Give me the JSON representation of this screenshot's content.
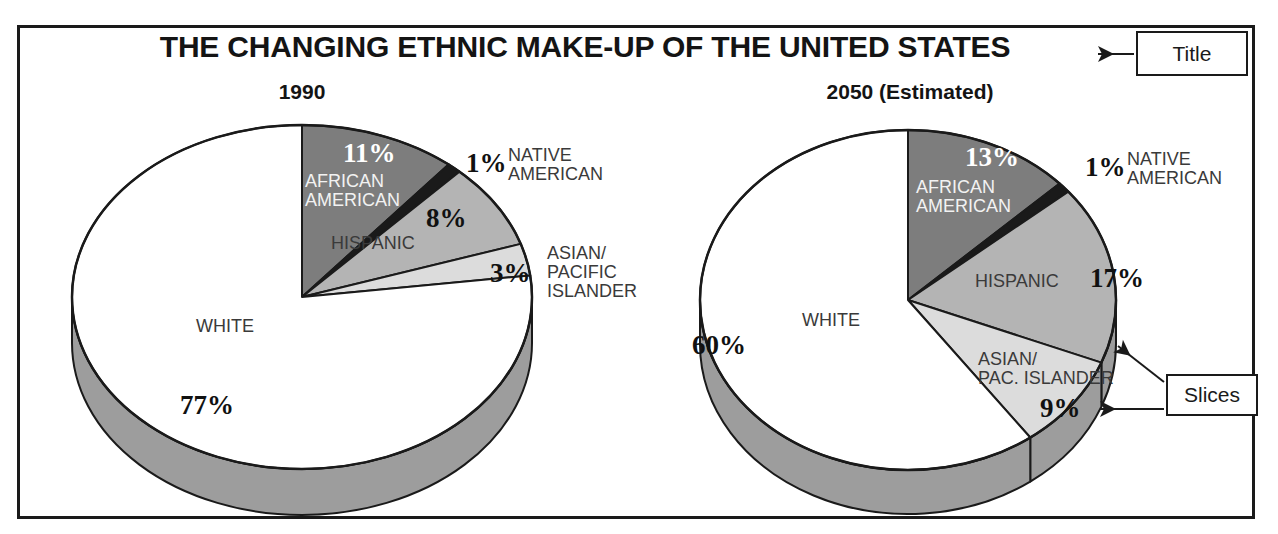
{
  "figure": {
    "title": "THE CHANGING ETHNIC MAKE-UP OF THE UNITED STATES",
    "callouts": [
      {
        "name": "title-callout",
        "label": "Title"
      },
      {
        "name": "slices-callout",
        "label": "Slices"
      }
    ]
  },
  "panels": [
    {
      "heading": "1990"
    },
    {
      "heading": "2050 (Estimated)"
    }
  ],
  "labels": {
    "p1": {
      "white_name": "WHITE",
      "white_pct": "77%",
      "african_name": "AFRICAN\nAMERICAN",
      "african_pct": "11%",
      "native_name": "NATIVE\nAMERICAN",
      "native_pct": "1%",
      "hispanic_name": "HISPANIC",
      "hispanic_pct": "8%",
      "asian_name": "ASIAN/\nPACIFIC\nISLANDER",
      "asian_pct": "3%"
    },
    "p2": {
      "white_name": "WHITE",
      "white_pct": "60%",
      "african_name": "AFRICAN\nAMERICAN",
      "african_pct": "13%",
      "native_name": "NATIVE\nAMERICAN",
      "native_pct": "1%",
      "hispanic_name": "HISPANIC",
      "hispanic_pct": "17%",
      "asian_name": "ASIAN/\nPAC. ISLANDER",
      "asian_pct": "9%"
    }
  },
  "colors": {
    "white_slice": "#ffffff",
    "african_slice": "#7d7d7d",
    "native_slice": "#1a1a1a",
    "hispanic_slice": "#b4b4b4",
    "asian_slice": "#dcdcdc",
    "side_wall": "#9d9d9d",
    "outline": "#1a1a1a",
    "frame": "#1a1a1a",
    "text": "#141414"
  },
  "chart_data": [
    {
      "type": "pie",
      "title": "1990",
      "categories": [
        "WHITE",
        "AFRICAN AMERICAN",
        "NATIVE AMERICAN",
        "HISPANIC",
        "ASIAN/PACIFIC ISLANDER"
      ],
      "values": [
        77,
        11,
        1,
        8,
        3
      ],
      "unit": "%",
      "legend": "inline-labels",
      "notes": "3-D pie, starts at 12 o'clock, clockwise order: AFRICAN AMERICAN, NATIVE AMERICAN, HISPANIC, ASIAN/PACIFIC ISLANDER, WHITE"
    },
    {
      "type": "pie",
      "title": "2050 (Estimated)",
      "categories": [
        "WHITE",
        "AFRICAN AMERICAN",
        "NATIVE AMERICAN",
        "HISPANIC",
        "ASIAN/PAC. ISLANDER"
      ],
      "values": [
        60,
        13,
        1,
        17,
        9
      ],
      "unit": "%",
      "legend": "inline-labels",
      "notes": "3-D pie, starts at 12 o'clock, clockwise order: AFRICAN AMERICAN, NATIVE AMERICAN, HISPANIC, ASIAN/PAC. ISLANDER, WHITE"
    }
  ]
}
